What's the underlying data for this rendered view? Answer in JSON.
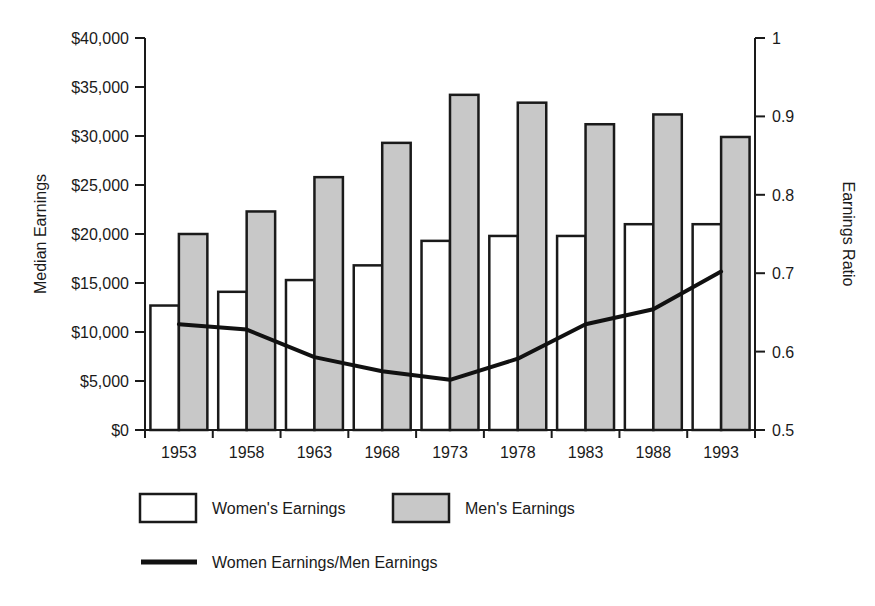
{
  "chart_data": {
    "type": "bar",
    "title": "",
    "subtitle": "",
    "xlabel": "",
    "ylabel": "Median Earnings",
    "y2label": "Earnings Ratio",
    "categories": [
      "1953",
      "1958",
      "1963",
      "1968",
      "1973",
      "1978",
      "1983",
      "1988",
      "1993"
    ],
    "series": [
      {
        "name": "Women's Earnings",
        "type": "bar",
        "axis": "left",
        "fill": "#ffffff",
        "stroke": "#1a1a1a",
        "values": [
          12700,
          14100,
          15300,
          16800,
          19300,
          19800,
          19800,
          21000,
          21000
        ]
      },
      {
        "name": "Men's Earnings",
        "type": "bar",
        "axis": "left",
        "fill": "#c8c8c8",
        "stroke": "#1a1a1a",
        "values": [
          20000,
          22300,
          25800,
          29300,
          34200,
          33400,
          31200,
          32200,
          29900
        ]
      },
      {
        "name": "Women Earnings/Men Earnings",
        "type": "line",
        "axis": "right",
        "stroke": "#111111",
        "values": [
          0.635,
          0.628,
          0.593,
          0.575,
          0.564,
          0.591,
          0.635,
          0.654,
          0.702
        ]
      }
    ],
    "ylim": [
      0,
      40000
    ],
    "yticks": [
      0,
      5000,
      10000,
      15000,
      20000,
      25000,
      30000,
      35000,
      40000
    ],
    "ytick_labels": [
      "$0",
      "$5,000",
      "$10,000",
      "$15,000",
      "$20,000",
      "$25,000",
      "$30,000",
      "$35,000",
      "$40,000"
    ],
    "y2lim": [
      0.5,
      1
    ],
    "y2ticks": [
      0.5,
      0.6,
      0.7,
      0.8,
      0.9,
      1
    ],
    "y2tick_labels": [
      "0.5",
      "0.6",
      "0.7",
      "0.8",
      "0.9",
      "1"
    ],
    "grid": false,
    "legend_position": "bottom"
  },
  "legend": {
    "entries": [
      {
        "label": "Women's Earnings",
        "marker": "swatch-white"
      },
      {
        "label": "Men's Earnings",
        "marker": "swatch-gray"
      },
      {
        "label": "Women Earnings/Men Earnings",
        "marker": "line-black"
      }
    ]
  },
  "colors": {
    "bar_women_fill": "#ffffff",
    "bar_men_fill": "#c8c8c8",
    "outline": "#1a1a1a",
    "line": "#111111",
    "background": "#ffffff"
  }
}
